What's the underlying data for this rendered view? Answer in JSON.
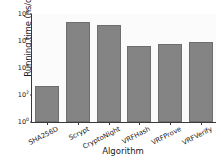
{
  "chart_data": {
    "type": "bar",
    "title": "",
    "xlabel": "Algorithm",
    "ylabel": "Running time (ns/op)",
    "yscale": "log",
    "ylim": [
      1,
      100000000
    ],
    "grid": false,
    "legend": null,
    "categories": [
      "SHA256D",
      "Scrypt",
      "CryptoNight",
      "VRFHash",
      "VRFProve",
      "VRFVerify"
    ],
    "values": [
      500,
      25000000,
      15000000,
      400000,
      650000,
      900000
    ],
    "bar_color": "#848484",
    "ytick_labels": [
      "10^0",
      "10^2",
      "10^4",
      "10^6",
      "10^8"
    ],
    "ytick_values": [
      1,
      100,
      10000,
      1000000,
      100000000
    ],
    "ytick_mantissa": "10",
    "ytick_exponents": [
      "0",
      "2",
      "4",
      "6",
      "8"
    ]
  }
}
